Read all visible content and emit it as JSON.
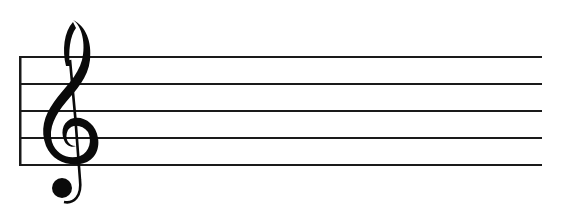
{
  "figure": {
    "clef": {
      "type": "treble",
      "icon": "treble-clef-icon"
    },
    "staff": {
      "line_count": 5,
      "line_color": "#1a1a1a",
      "background": "#ffffff"
    }
  }
}
